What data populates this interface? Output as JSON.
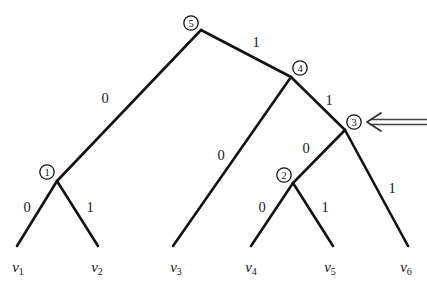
{
  "figure": {
    "kind": "binary-code-tree",
    "background_color": "#ffffff",
    "line_color": "#131313",
    "arrow_color": "#3a3a3a"
  },
  "nodes": [
    {
      "id": "n5",
      "label": "5",
      "cx": 191,
      "cy": 23,
      "vx": 201,
      "vy": 30
    },
    {
      "id": "n4",
      "label": "4",
      "cx": 300,
      "cy": 68,
      "vx": 291,
      "vy": 77
    },
    {
      "id": "n3",
      "label": "3",
      "cx": 354,
      "cy": 122,
      "vx": 345,
      "vy": 130
    },
    {
      "id": "n1",
      "label": "1",
      "cx": 47,
      "cy": 172,
      "vx": 57,
      "vy": 181
    },
    {
      "id": "n2",
      "label": "2",
      "cx": 284,
      "cy": 175,
      "vx": 293,
      "vy": 183
    }
  ],
  "edges": [
    {
      "id": "e-5-1",
      "from": "n5",
      "to": "n1",
      "label": "0",
      "lx": 105,
      "ly": 98
    },
    {
      "id": "e-5-4",
      "from": "n5",
      "to": "n4",
      "label": "1",
      "lx": 256,
      "ly": 42
    },
    {
      "id": "e-4-v3",
      "from": "n4",
      "to": "v3",
      "label": "0",
      "lx": 221,
      "ly": 155
    },
    {
      "id": "e-4-3",
      "from": "n4",
      "to": "n3",
      "label": "1",
      "lx": 329,
      "ly": 100
    },
    {
      "id": "e-3-2",
      "from": "n3",
      "to": "n2",
      "label": "0",
      "lx": 306,
      "ly": 148
    },
    {
      "id": "e-3-v6",
      "from": "n3",
      "to": "v6",
      "label": "1",
      "lx": 392,
      "ly": 188
    },
    {
      "id": "e-1-v1",
      "from": "n1",
      "to": "v1",
      "label": "0",
      "lx": 27,
      "ly": 207
    },
    {
      "id": "e-1-v2",
      "from": "n1",
      "to": "v2",
      "label": "1",
      "lx": 90,
      "ly": 207
    },
    {
      "id": "e-2-v4",
      "from": "n2",
      "to": "v4",
      "label": "0",
      "lx": 262,
      "ly": 207
    },
    {
      "id": "e-2-v5",
      "from": "n2",
      "to": "v5",
      "label": "1",
      "lx": 325,
      "ly": 207
    }
  ],
  "leaves": [
    {
      "id": "v1",
      "base": "v",
      "sub": "1",
      "x": 18,
      "y": 270,
      "ex": 17,
      "ey": 246
    },
    {
      "id": "v2",
      "base": "v",
      "sub": "2",
      "x": 97,
      "y": 270,
      "ex": 98,
      "ey": 246
    },
    {
      "id": "v3",
      "base": "v",
      "sub": "3",
      "x": 176,
      "y": 270,
      "ex": 173,
      "ey": 246
    },
    {
      "id": "v4",
      "base": "v",
      "sub": "4",
      "x": 251,
      "y": 270,
      "ex": 251,
      "ey": 246
    },
    {
      "id": "v5",
      "base": "v",
      "sub": "5",
      "x": 330,
      "y": 270,
      "ex": 333,
      "ey": 246
    },
    {
      "id": "v6",
      "base": "v",
      "sub": "6",
      "x": 406,
      "y": 270,
      "ex": 408,
      "ey": 246
    }
  ],
  "annotation": {
    "id": "pointer-arrow",
    "description": "double-line left arrow pointing at node 3",
    "tip_x": 367,
    "tip_y": 122,
    "tail_x": 427,
    "tail_y": 122
  }
}
